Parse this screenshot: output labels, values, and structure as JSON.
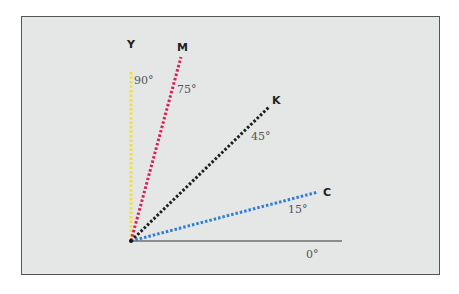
{
  "diagram": {
    "type": "angle-diagram",
    "origin": [
      131,
      241
    ],
    "baseline": {
      "label": "0°",
      "end": [
        342,
        241
      ],
      "color": "#333333"
    },
    "rays": [
      {
        "name": "Y",
        "angle": "90°",
        "color": "#f2e03a",
        "end": [
          131,
          72
        ],
        "label_pos": [
          131,
          47
        ],
        "angle_pos": [
          136,
          83
        ]
      },
      {
        "name": "M",
        "angle": "75°",
        "color": "#d6245a",
        "end": [
          181,
          57
        ],
        "label_pos": [
          184,
          50
        ],
        "angle_pos": [
          176,
          93
        ]
      },
      {
        "name": "K",
        "angle": "45°",
        "color": "#1e1e1e",
        "end": [
          269,
          107
        ],
        "label_pos": [
          273,
          102
        ],
        "angle_pos": [
          251,
          140
        ]
      },
      {
        "name": "C",
        "angle": "15°",
        "color": "#2f7fd4",
        "end": [
          318,
          192
        ],
        "label_pos": [
          324,
          194
        ],
        "angle_pos": [
          288,
          213
        ]
      }
    ]
  },
  "labels": {
    "Y": "Y",
    "M": "M",
    "K": "K",
    "C": "C",
    "deg90": "90°",
    "deg75": "75°",
    "deg45": "45°",
    "deg15": "15°",
    "deg0": "0°"
  }
}
